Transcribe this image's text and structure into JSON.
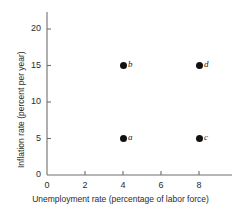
{
  "chart_data": {
    "type": "scatter",
    "title": "",
    "subtitle": "",
    "xlabel": "Unemployment rate (percentage of labor force)",
    "ylabel": "Inflation rate (percent per year)",
    "xlim": [
      0,
      9.75
    ],
    "ylim": [
      0,
      22.5
    ],
    "xticks": [
      0,
      2,
      4,
      6,
      8
    ],
    "xticklabels": [
      "0",
      "2",
      "4",
      "6",
      "8"
    ],
    "yticks": [
      0,
      5,
      10,
      15,
      20
    ],
    "yticklabels": [
      "0",
      "5",
      "10",
      "15",
      "20"
    ],
    "grid": false,
    "legend": "none",
    "points": [
      {
        "label": "a",
        "x": 4,
        "y": 5
      },
      {
        "label": "b",
        "x": 4,
        "y": 15
      },
      {
        "label": "c",
        "x": 8,
        "y": 5
      },
      {
        "label": "d",
        "x": 8,
        "y": 15
      }
    ],
    "point_color": "#111111",
    "axis_color": "#6e6e6e",
    "text_color": "#2b2b2b",
    "background_color": "#ffffff"
  },
  "geometry": {
    "origin_x": 47,
    "origin_y": 175,
    "axis_top_y": 12,
    "axis_right_x": 232,
    "px_per_x_unit": 19,
    "px_per_y_unit": 7.3,
    "tick_len": 4
  }
}
